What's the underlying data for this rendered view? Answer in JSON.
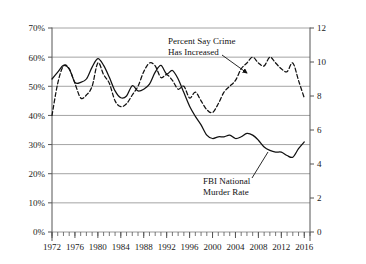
{
  "chart_data": {
    "type": "line",
    "title": "",
    "subtitle": "",
    "xlabel": "",
    "ylabel": "",
    "y2label": "",
    "grid": true,
    "legend_position": "inline-annotations",
    "xlim": [
      1972,
      2017
    ],
    "ylim": [
      0,
      70
    ],
    "y2lim": [
      0,
      12
    ],
    "ytick_labels": [
      "0%",
      "10%",
      "20%",
      "30%",
      "40%",
      "50%",
      "60%",
      "70%"
    ],
    "ytick_values": [
      0,
      10,
      20,
      30,
      40,
      50,
      60,
      70
    ],
    "y2tick_labels": [
      "0",
      "2",
      "4",
      "6",
      "8",
      "10",
      "12"
    ],
    "y2tick_values": [
      0,
      2,
      4,
      6,
      8,
      10,
      12
    ],
    "xtick_labels": [
      "1972",
      "1976",
      "1980",
      "1984",
      "1988",
      "1992",
      "1996",
      "2000",
      "2004",
      "2008",
      "2012",
      "2016"
    ],
    "xtick_values": [
      1972,
      1976,
      1980,
      1984,
      1988,
      1992,
      1996,
      2000,
      2004,
      2008,
      2012,
      2016
    ],
    "minor_xticks_every": 1,
    "x": [
      1972,
      1973,
      1974,
      1975,
      1976,
      1977,
      1978,
      1979,
      1980,
      1981,
      1982,
      1983,
      1984,
      1985,
      1986,
      1987,
      1988,
      1989,
      1990,
      1991,
      1992,
      1993,
      1994,
      1995,
      1996,
      1997,
      1998,
      1999,
      2000,
      2001,
      2002,
      2003,
      2004,
      2005,
      2006,
      2007,
      2008,
      2009,
      2010,
      2011,
      2012,
      2013,
      2014,
      2015,
      2016
    ],
    "series": [
      {
        "name": "Percent Say Crime Has Increased",
        "axis": "left",
        "style": "dashed",
        "color": "#111111",
        "units": "percent",
        "values": [
          40,
          51,
          57,
          56,
          51,
          46,
          47,
          50,
          58,
          54,
          51,
          45,
          43,
          44,
          47,
          50,
          55,
          58,
          57,
          53,
          54,
          52,
          49,
          50,
          46,
          48,
          45,
          42,
          41,
          44,
          48,
          50,
          52,
          56,
          58,
          60,
          58,
          57,
          60,
          58,
          56,
          55,
          58,
          52,
          46
        ]
      },
      {
        "name": "FBI National Murder Rate",
        "axis": "right",
        "style": "solid",
        "color": "#111111",
        "units": "per 100,000",
        "values": [
          9.0,
          9.4,
          9.8,
          9.6,
          8.8,
          8.8,
          9.0,
          9.7,
          10.2,
          9.8,
          9.1,
          8.3,
          7.9,
          8.0,
          8.6,
          8.3,
          8.4,
          8.7,
          9.4,
          9.8,
          9.3,
          9.5,
          9.0,
          8.2,
          7.4,
          6.8,
          6.3,
          5.7,
          5.5,
          5.6,
          5.6,
          5.7,
          5.5,
          5.6,
          5.8,
          5.7,
          5.4,
          5.0,
          4.8,
          4.7,
          4.7,
          4.5,
          4.4,
          4.9,
          5.3
        ]
      }
    ],
    "annotations": [
      {
        "name": "percent-say-crime-annotation",
        "lines": [
          "Percent Say Crime",
          "Has Increased"
        ],
        "text_x": 168,
        "text_y": 44,
        "arrow": {
          "x1": 222,
          "y1": 55,
          "x2": 247,
          "y2": 73,
          "head": true
        }
      },
      {
        "name": "fbi-murder-rate-annotation",
        "lines": [
          "FBI National",
          "Murder Rate"
        ],
        "text_x": 203,
        "text_y": 184,
        "arrow": {
          "x1": 252,
          "y1": 178,
          "x2": 268,
          "y2": 152,
          "head": false
        }
      }
    ]
  }
}
